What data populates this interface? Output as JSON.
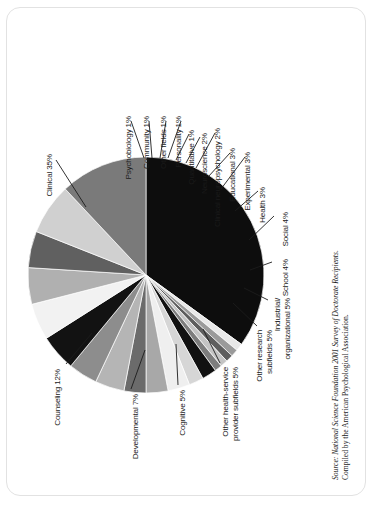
{
  "chart_data": {
    "type": "pie",
    "title": "",
    "subtitle": "",
    "xlabel": "",
    "ylabel": "",
    "legend_position": "none",
    "grid": false,
    "label_format": "{name} {value}%",
    "rotation_degrees": 90,
    "categories": [
      "Clinical",
      "Psychobiology",
      "Community",
      "Other fields",
      "Personality",
      "Quantitative",
      "Neuroscience",
      "Clinical neuropsychology",
      "Educational",
      "Experimental",
      "Health",
      "Social",
      "School",
      "Industrial/ organizational",
      "Other research subfields",
      "Other health-service provider subfields",
      "Cognitive",
      "Developmental",
      "Counseling"
    ],
    "values": [
      35,
      1,
      1,
      1,
      1,
      1,
      2,
      2,
      3,
      3,
      3,
      4,
      4,
      5,
      5,
      5,
      5,
      7,
      12
    ],
    "slices": [
      {
        "name": "Clinical",
        "value": 35,
        "label": "Clinical 35%",
        "color": "#0d0d0d"
      },
      {
        "name": "Psychobiology",
        "value": 1,
        "label": "Psychobiology 1%",
        "color": "#e8e8e8"
      },
      {
        "name": "Community",
        "value": 1,
        "label": "Community 1%",
        "color": "#9a9a9a"
      },
      {
        "name": "Other fields",
        "value": 1,
        "label": "Other fields 1%",
        "color": "#5e5e5e"
      },
      {
        "name": "Personality",
        "value": 1,
        "label": "Personality 1%",
        "color": "#c4c4c4"
      },
      {
        "name": "Quantitative",
        "value": 1,
        "label": "Quantitative 1%",
        "color": "#7d7d7d"
      },
      {
        "name": "Neuroscience",
        "value": 2,
        "label": "Neuroscience 2%",
        "color": "#111111"
      },
      {
        "name": "Clinical neuropsychology",
        "value": 2,
        "label": "Clinical neuropsychology 2%",
        "color": "#d6d6d6"
      },
      {
        "name": "Educational",
        "value": 3,
        "label": "Educational 3%",
        "color": "#efefef"
      },
      {
        "name": "Experimental",
        "value": 3,
        "label": "Experimental 3%",
        "color": "#a8a8a8"
      },
      {
        "name": "Health",
        "value": 3,
        "label": "Health 3%",
        "color": "#6b6b6b"
      },
      {
        "name": "Social",
        "value": 4,
        "label": "Social 4%",
        "color": "#b5b5b5"
      },
      {
        "name": "School",
        "value": 4,
        "label": "School 4%",
        "color": "#8d8d8d"
      },
      {
        "name": "Industrial/ organizational",
        "value": 5,
        "label": "Industrial/ organizational 5%",
        "color": "#121212"
      },
      {
        "name": "Other research subfields",
        "value": 5,
        "label": "Other research subfields 5%",
        "color": "#f2f2f2"
      },
      {
        "name": "Other health-service provider subfields",
        "value": 5,
        "label": "Other health-service provider subfields 5%",
        "color": "#b0b0b0"
      },
      {
        "name": "Cognitive",
        "value": 5,
        "label": "Cognitive 5%",
        "color": "#606060"
      },
      {
        "name": "Developmental",
        "value": 7,
        "label": "Developmental 7%",
        "color": "#d0d0d0"
      },
      {
        "name": "Counseling",
        "value": 12,
        "label": "Counseling 12%",
        "color": "#7a7a7a"
      }
    ]
  },
  "labels": {
    "clinical": "Clinical 35%",
    "psychobiology": "Psychobiology 1%",
    "community": "Community 1%",
    "other_fields": "Other fields 1%",
    "personality": "Personality 1%",
    "quantitative": "Quantitative 1%",
    "neuroscience": "Neuroscience 2%",
    "clinical_neuropsychology": "Clinical neuropsychology 2%",
    "educational": "Educational 3%",
    "experimental": "Experimental 3%",
    "health": "Health 3%",
    "social": "Social 4%",
    "school": "School 4%",
    "industrial_line1": "Industrial/",
    "industrial_line2": "organizational 5%",
    "other_research_line1": "Other research",
    "other_research_line2": "subfields 5%",
    "other_hsp_line1": "Other health-service",
    "other_hsp_line2": "provider subfields 5%",
    "cognitive": "Cognitive 5%",
    "developmental": "Developmental 7%",
    "counseling": "Counseling 12%"
  },
  "source": {
    "line1": "Source: National Science Foundation 2001 Survey of Doctorate Recipients.",
    "line2": "Compiled by the American Psychological Association."
  },
  "colors": {
    "background": "#ffffff",
    "frame": "#e2e2e2",
    "text": "#1a1a1a",
    "leader": "#1c1c1c"
  }
}
